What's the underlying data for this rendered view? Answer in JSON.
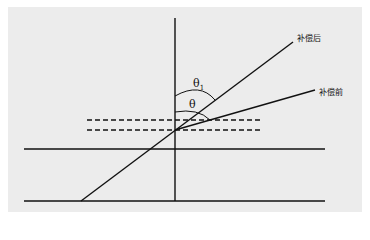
{
  "diagram": {
    "background_color": "#ececec",
    "line_color": "#111111",
    "labels": {
      "after_compensation": "补偿后",
      "before_compensation": "补偿前",
      "theta1": "θ",
      "theta1_subscript": "1",
      "theta": "θ"
    },
    "elements": {
      "horizontal_lines": [
        {
          "name": "upper-boundary",
          "y": 149,
          "x1": 24,
          "x2": 325
        },
        {
          "name": "lower-boundary",
          "y": 201,
          "x1": 24,
          "x2": 325
        }
      ],
      "dashed_lines": [
        {
          "name": "dashed-upper",
          "y": 120,
          "x1": 87,
          "x2": 262
        },
        {
          "name": "dashed-lower",
          "y": 130,
          "x1": 87,
          "x2": 262
        }
      ],
      "vertical_normal": {
        "x": 175,
        "y1": 18,
        "y2": 201
      },
      "ray_after": {
        "x1": 81,
        "y1": 201,
        "x2": 293,
        "y2": 42
      },
      "ray_before": {
        "x1": 175,
        "y1": 130,
        "x2": 315,
        "y2": 90
      }
    }
  }
}
